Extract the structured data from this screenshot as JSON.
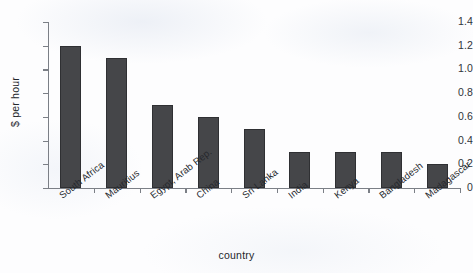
{
  "chart_data": {
    "type": "bar",
    "title": "",
    "xlabel": "country",
    "ylabel": "$ per hour",
    "categories": [
      "South Africa",
      "Mauritius",
      "Egypt, Arab Rep.",
      "China",
      "Sri Lanka",
      "India",
      "Kenya",
      "Bangladesh",
      "Madagascar"
    ],
    "values": [
      1.2,
      1.1,
      0.7,
      0.6,
      0.5,
      0.3,
      0.3,
      0.3,
      0.2
    ],
    "ylim": [
      0,
      1.4
    ],
    "ytick_labels": [
      "0",
      "0.2",
      "0.4",
      "0.6",
      "0.8",
      "1.0",
      "1.2",
      "1.4"
    ],
    "ytick_values": [
      0,
      0.2,
      0.4,
      0.6,
      0.8,
      1.0,
      1.2,
      1.4
    ],
    "grid": false,
    "legend": false,
    "legend_position": "none",
    "bar_color": "#454649",
    "axis_color": "#7b7f86"
  }
}
